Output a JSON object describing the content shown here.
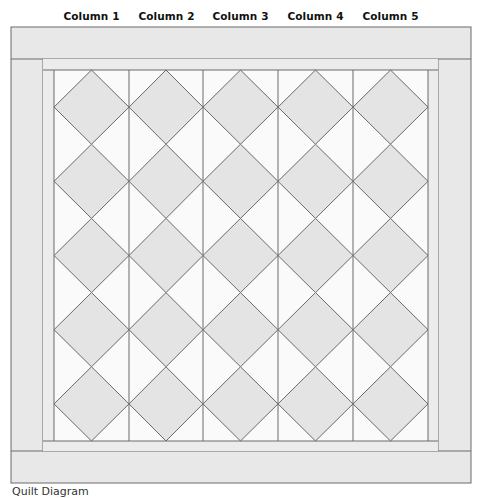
{
  "diagram": {
    "column_labels": [
      "Column 1",
      "Column 2",
      "Column 3",
      "Column 4",
      "Column 5"
    ],
    "caption": "Quilt Diagram",
    "layout": {
      "outer": {
        "x": 11,
        "y": 27,
        "w": 460,
        "h": 456
      },
      "border_width": 32,
      "sash_width": 10,
      "columns": 5,
      "rows_per_column": 5,
      "column_x": [
        54,
        129,
        203,
        278,
        353,
        428
      ],
      "field_top": 70,
      "field_bottom": 441
    },
    "colors": {
      "border_fill": "#e8e8e8",
      "sash_fill": "#ececec",
      "diamond_fill": "#e4e4e4",
      "background_fill": "#fafafa",
      "line": "#6a6a6a"
    }
  }
}
